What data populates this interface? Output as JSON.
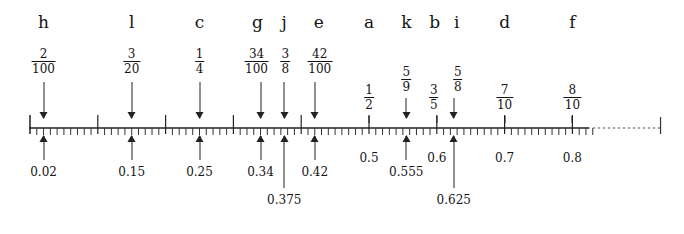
{
  "figure": {
    "type": "number-line",
    "axis": {
      "x_start_px": 30,
      "x_end_px": 665,
      "value_at_x_start": 0.0,
      "px_per_unit": 678,
      "minor_tick_step": 0.01,
      "major_tick_step": 0.1,
      "dashed_from": 0.83,
      "dashed_to": 0.93,
      "line_color": "#222222"
    },
    "axis_tick_labels": [
      {
        "text": "0.5",
        "value": 0.5
      },
      {
        "text": "0.6",
        "value": 0.6
      },
      {
        "text": "0.7",
        "value": 0.7
      },
      {
        "text": "0.8",
        "value": 0.8
      }
    ],
    "points": [
      {
        "letter": "h",
        "fraction_num": "2",
        "fraction_den": "100",
        "decimal": "0.02",
        "value": 0.02,
        "tier": "high",
        "connector": "arrow",
        "below": "arrow"
      },
      {
        "letter": "l",
        "fraction_num": "3",
        "fraction_den": "20",
        "decimal": "0.15",
        "value": 0.15,
        "tier": "high",
        "connector": "arrow",
        "below": "arrow"
      },
      {
        "letter": "c",
        "fraction_num": "1",
        "fraction_den": "4",
        "decimal": "0.25",
        "value": 0.25,
        "tier": "high",
        "connector": "arrow",
        "below": "arrow"
      },
      {
        "letter": "g",
        "fraction_num": "34",
        "fraction_den": "100",
        "decimal": "0.34",
        "value": 0.34,
        "tier": "high",
        "connector": "arrow",
        "below": "arrow"
      },
      {
        "letter": "j",
        "fraction_num": "3",
        "fraction_den": "8",
        "decimal": "0.375",
        "value": 0.375,
        "tier": "high",
        "connector": "arrow",
        "below": "arrow"
      },
      {
        "letter": "e",
        "fraction_num": "42",
        "fraction_den": "100",
        "decimal": "0.42",
        "value": 0.42,
        "tier": "high",
        "connector": "arrow",
        "below": "arrow"
      },
      {
        "letter": "a",
        "fraction_num": "1",
        "fraction_den": "2",
        "decimal": "",
        "value": 0.5,
        "tier": "low",
        "connector": "tick",
        "below": "none"
      },
      {
        "letter": "k",
        "fraction_num": "5",
        "fraction_den": "9",
        "decimal": "0.555",
        "value": 0.555,
        "tier": "mid",
        "connector": "arrow",
        "below": "arrow"
      },
      {
        "letter": "b",
        "fraction_num": "3",
        "fraction_den": "5",
        "decimal": "",
        "value": 0.6,
        "tier": "low",
        "connector": "tick",
        "below": "none"
      },
      {
        "letter": "i",
        "fraction_num": "5",
        "fraction_den": "8",
        "decimal": "0.625",
        "value": 0.625,
        "tier": "mid",
        "connector": "arrow",
        "below": "arrow"
      },
      {
        "letter": "d",
        "fraction_num": "7",
        "fraction_den": "10",
        "decimal": "",
        "value": 0.7,
        "tier": "low",
        "connector": "tick",
        "below": "none"
      },
      {
        "letter": "f",
        "fraction_num": "8",
        "fraction_den": "10",
        "decimal": "",
        "value": 0.8,
        "tier": "low",
        "connector": "tick",
        "below": "none"
      }
    ]
  }
}
